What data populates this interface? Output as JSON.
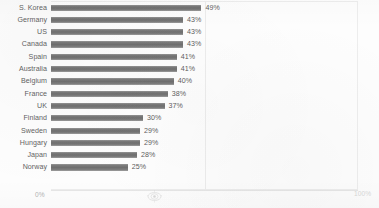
{
  "chart_data": {
    "type": "bar",
    "orientation": "horizontal",
    "title": "",
    "subtitle": "",
    "xlabel": "",
    "ylabel": "",
    "categories": [
      "S. Korea",
      "Germany",
      "US",
      "Canada",
      "Spain",
      "Australia",
      "Belgium",
      "France",
      "UK",
      "Finland",
      "Sweden",
      "Hungary",
      "Japan",
      "Norway"
    ],
    "values": [
      49,
      43,
      43,
      43,
      41,
      41,
      40,
      38,
      37,
      30,
      29,
      29,
      28,
      25
    ],
    "value_labels": [
      "49%",
      "43%",
      "43%",
      "43%",
      "41%",
      "41%",
      "40%",
      "38%",
      "37%",
      "30%",
      "29%",
      "29%",
      "28%",
      "25%"
    ],
    "xlim": [
      0,
      100
    ],
    "axis_ticks": [
      "0%",
      "100%"
    ],
    "grid": true,
    "gridlines_at": [
      50
    ],
    "legend": "none",
    "bar_color": "#7c7c7c",
    "label_color": "#636363",
    "axis_color": "#b3b3b3",
    "background": "#fdfdfd"
  },
  "axis": {
    "min_label": "0%",
    "max_label": "100%"
  },
  "marks": {
    "emblem": "page-emblem-icon"
  }
}
